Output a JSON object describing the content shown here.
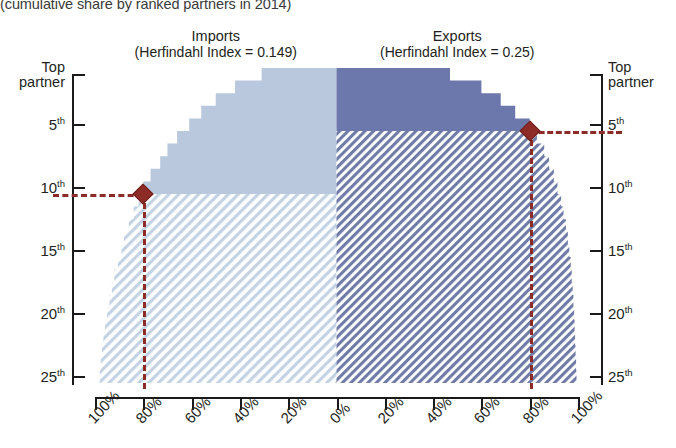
{
  "subtitle": "(cumulative share by ranked partners in 2014)",
  "panels": [
    {
      "key": "imports",
      "name": "Imports",
      "index_label": "(Herfindahl Index = 0.149)",
      "herfindahl": 0.149
    },
    {
      "key": "exports",
      "name": "Exports",
      "index_label": "(Herfindahl Index = 0.25)",
      "herfindahl": 0.25
    }
  ],
  "axes": {
    "y_ticks_left": [
      "Top partner",
      "5th",
      "10th",
      "15th",
      "20th",
      "25th"
    ],
    "y_ticks_right": [
      "Top partner",
      "5th",
      "10th",
      "15th",
      "20th",
      "25th"
    ],
    "x_ticks": [
      "100%",
      "80%",
      "60%",
      "40%",
      "20%",
      "0%",
      "20%",
      "40%",
      "60%",
      "80%",
      "100%"
    ]
  },
  "markers": [
    {
      "panel": "imports",
      "rank_label": "10th",
      "rank": 10,
      "share_label": "80%",
      "share": 80
    },
    {
      "panel": "exports",
      "rank_label": "5th",
      "rank": 5,
      "share_label": "80%",
      "share": 80
    }
  ],
  "colors": {
    "imports_solid": "#b9c8dd",
    "imports_hatch": "#c9d6e5",
    "exports_solid": "#6c77ac",
    "exports_hatch": "#6f7ca8",
    "marker": "#8d2b26",
    "axis": "#1a1a1a"
  },
  "chart_data": {
    "type": "area",
    "title": "",
    "subtitle": "(cumulative share by ranked partners in 2014)",
    "xlabel": "",
    "ylabel": "Partner rank",
    "ylim": [
      1,
      25
    ],
    "xlim": [
      0,
      100
    ],
    "grid": false,
    "legend": "none",
    "orientation": "mirrored-horizontal",
    "x_tick_labels": [
      "100%",
      "80%",
      "60%",
      "40%",
      "20%",
      "0%",
      "20%",
      "40%",
      "60%",
      "80%",
      "100%"
    ],
    "y_tick_labels": [
      "Top partner",
      "5th",
      "10th",
      "15th",
      "20th",
      "25th"
    ],
    "y_tick_ranks": [
      1,
      5,
      10,
      15,
      20,
      25
    ],
    "ranks": [
      1,
      2,
      3,
      4,
      5,
      6,
      7,
      8,
      9,
      10,
      11,
      12,
      13,
      14,
      15,
      16,
      17,
      18,
      19,
      20,
      21,
      22,
      23,
      24,
      25
    ],
    "series": [
      {
        "name": "Imports",
        "herfindahl_index": 0.149,
        "direction": "left",
        "annotation": "(Herfindahl Index = 0.149)",
        "marker": {
          "rank": 10,
          "cumulative_share": 80
        },
        "cumulative_share": [
          31,
          42,
          50,
          56,
          61,
          66,
          70,
          73,
          77,
          80,
          82,
          84,
          86,
          88,
          89,
          90.5,
          92,
          93,
          94,
          95,
          95.8,
          96.5,
          97.1,
          97.6,
          98
        ]
      },
      {
        "name": "Exports",
        "herfindahl_index": 0.25,
        "direction": "right",
        "annotation": "(Herfindahl Index = 0.25)",
        "marker": {
          "rank": 5,
          "cumulative_share": 80
        },
        "cumulative_share": [
          47,
          60,
          68,
          74,
          80,
          83,
          86,
          88,
          90,
          91.5,
          93,
          94,
          95,
          95.8,
          96.4,
          97,
          97.4,
          97.8,
          98.1,
          98.4,
          98.6,
          98.8,
          99,
          99.2,
          99.4
        ]
      }
    ]
  }
}
